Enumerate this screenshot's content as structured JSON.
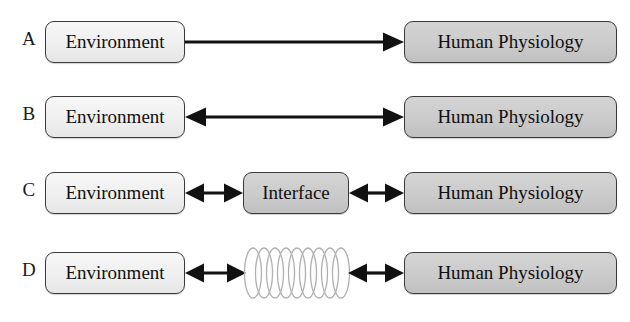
{
  "figure": {
    "type": "diagram",
    "background_color": "#ffffff",
    "node_fill_light": "#efefef",
    "node_fill_gray": "#cbcbcb",
    "stroke_color": "#3a3a3a",
    "arrow_color": "#111111",
    "coil_color": "#b3b3b3"
  },
  "rows": [
    {
      "label": "A",
      "left_node": "Environment",
      "right_node": "Human Physiology",
      "middle_node": null,
      "connector": "arrow-right",
      "connector_name": "one-way-arrow-environment-to-physiology"
    },
    {
      "label": "B",
      "left_node": "Environment",
      "right_node": "Human Physiology",
      "middle_node": null,
      "connector": "arrow-both",
      "connector_name": "two-way-arrow-environment-physiology"
    },
    {
      "label": "C",
      "left_node": "Environment",
      "right_node": "Human Physiology",
      "middle_node": "Interface",
      "connector": "arrow-both",
      "connector_name": "two-way-arrows-through-interface"
    },
    {
      "label": "D",
      "left_node": "Environment",
      "right_node": "Human Physiology",
      "middle_node": "coil",
      "middle_node_icon": "coil-spring-icon",
      "connector": "arrow-both",
      "connector_name": "two-way-arrows-through-coil"
    }
  ],
  "coil": {
    "loops": 8,
    "stroke": "#b3b3b3"
  }
}
